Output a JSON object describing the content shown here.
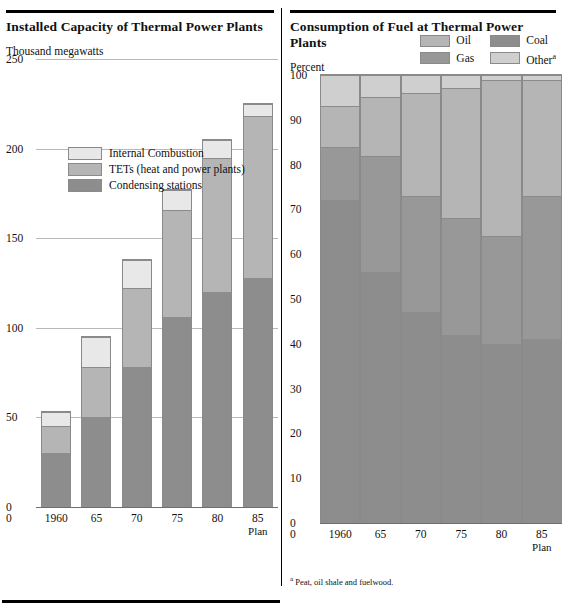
{
  "left": {
    "title": "Installed Capacity of Thermal Power Plants",
    "unit_label": "Thousand megawatts",
    "legend": [
      {
        "label": "Internal Combustion",
        "color": "#e8e8e8",
        "key": "internal_combustion"
      },
      {
        "label": "TETs  (heat and power plants)",
        "color": "#b5b5b5",
        "key": "tets"
      },
      {
        "label": "Condensing stations",
        "color": "#8d8d8d",
        "key": "condensing"
      }
    ],
    "yticks": [
      "250",
      "200",
      "150",
      "100",
      "50",
      "0"
    ],
    "xlabels": [
      {
        "label": "1960",
        "sub": ""
      },
      {
        "label": "65",
        "sub": ""
      },
      {
        "label": "70",
        "sub": ""
      },
      {
        "label": "75",
        "sub": ""
      },
      {
        "label": "80",
        "sub": ""
      },
      {
        "label": "85",
        "sub": "Plan"
      }
    ]
  },
  "right": {
    "title": "Consumption of Fuel at Thermal Power Plants",
    "unit_label": "Percent",
    "legend": [
      {
        "label": "Oil",
        "color": "#b5b5b5",
        "key": "oil"
      },
      {
        "label": "Coal",
        "color": "#8d8d8d",
        "key": "coal"
      },
      {
        "label": "Gas",
        "color": "#989898",
        "key": "gas"
      },
      {
        "label": "Other",
        "color": "#cfcfcf",
        "key": "other",
        "footnote_marker": "a"
      }
    ],
    "yticks": [
      "100",
      "90",
      "80",
      "70",
      "60",
      "50",
      "40",
      "30",
      "20",
      "10",
      "0"
    ],
    "xlabels": [
      {
        "label": "1960",
        "sub": ""
      },
      {
        "label": "65",
        "sub": ""
      },
      {
        "label": "70",
        "sub": ""
      },
      {
        "label": "75",
        "sub": ""
      },
      {
        "label": "80",
        "sub": ""
      },
      {
        "label": "85",
        "sub": "Plan"
      }
    ],
    "footnote": "Peat, oil shale and fuelwood.",
    "footnote_marker": "a"
  },
  "chart_data": [
    {
      "type": "bar",
      "stacked": true,
      "title": "Installed Capacity of Thermal Power Plants",
      "xlabel": "",
      "ylabel": "Thousand megawatts",
      "ylim": [
        0,
        250
      ],
      "ytick_step": 50,
      "grid": true,
      "legend_position": "inside-top-left",
      "categories": [
        "1960",
        "65",
        "70",
        "75",
        "80",
        "85 Plan"
      ],
      "series": [
        {
          "name": "Condensing stations",
          "color": "#8d8d8d",
          "values": [
            30,
            50,
            78,
            106,
            120,
            128
          ]
        },
        {
          "name": "TETs  (heat and power plants)",
          "color": "#b5b5b5",
          "values": [
            15,
            28,
            44,
            60,
            75,
            90
          ]
        },
        {
          "name": "Internal Combustion",
          "color": "#e8e8e8",
          "values": [
            8,
            17,
            16,
            11,
            10,
            7
          ]
        }
      ],
      "totals": [
        53,
        95,
        138,
        177,
        205,
        225
      ]
    },
    {
      "type": "bar",
      "stacked": true,
      "title": "Consumption of Fuel at Thermal Power Plants",
      "xlabel": "",
      "ylabel": "Percent",
      "ylim": [
        0,
        100
      ],
      "ytick_step": 10,
      "grid": true,
      "legend_position": "top-right",
      "categories": [
        "1960",
        "65",
        "70",
        "75",
        "80",
        "85 Plan"
      ],
      "series": [
        {
          "name": "Coal",
          "color": "#8d8d8d",
          "values": [
            72,
            56,
            47,
            42,
            40,
            41
          ]
        },
        {
          "name": "Gas",
          "color": "#989898",
          "values": [
            12,
            26,
            26,
            26,
            24,
            32
          ]
        },
        {
          "name": "Oil",
          "color": "#b5b5b5",
          "values": [
            9,
            13,
            23,
            29,
            35,
            26
          ]
        },
        {
          "name": "Other",
          "color": "#cfcfcf",
          "values": [
            7,
            5,
            4,
            3,
            1,
            1
          ]
        }
      ],
      "totals": [
        100,
        100,
        100,
        100,
        100,
        100
      ],
      "note": "Other = Peat, oil shale and fuelwood."
    }
  ]
}
